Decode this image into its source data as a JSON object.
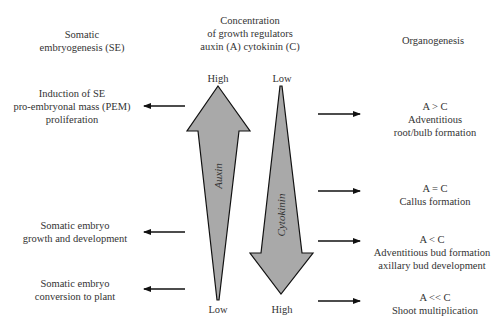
{
  "headers": {
    "left": [
      "Somatic",
      "embryogenesis (SE)"
    ],
    "center": [
      "Concentration",
      "of growth regulators",
      "auxin (A) cytokinin (C)"
    ],
    "right": [
      "Organogenesis"
    ]
  },
  "arrows": {
    "auxin": {
      "label": "Auxin",
      "top": "High",
      "bottom": "Low",
      "direction": "up"
    },
    "cytokinin": {
      "label": "Cytokinin",
      "top": "Low",
      "bottom": "High",
      "direction": "down"
    },
    "fill_color": "#a9a9a9",
    "stroke_color": "#111111"
  },
  "left_items": [
    {
      "lines": [
        "Induction of SE",
        "pro-embryonal mass (PEM)",
        "proliferation"
      ]
    },
    {
      "lines": [
        "Somatic embryo",
        "growth and development"
      ]
    },
    {
      "lines": [
        "Somatic embryo",
        "conversion to plant"
      ]
    }
  ],
  "right_items": [
    {
      "lines": [
        "A > C",
        "Adventitious",
        "root/bulb formation"
      ]
    },
    {
      "lines": [
        "A = C",
        "Callus formation"
      ]
    },
    {
      "lines": [
        "A < C",
        "Adventitious bud formation",
        "axillary bud development"
      ]
    },
    {
      "lines": [
        "A << C",
        "Shoot multiplication"
      ]
    }
  ]
}
